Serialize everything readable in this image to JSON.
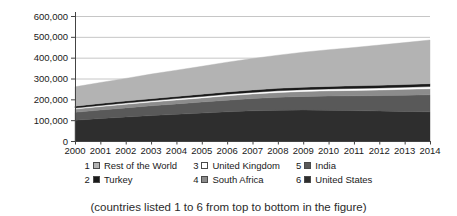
{
  "figure": {
    "caption": "(countries listed 1 to 6 from top to bottom in the figure)"
  },
  "chart_data": {
    "type": "area",
    "stacked": true,
    "title": "",
    "xlabel": "",
    "ylabel": "",
    "grid": true,
    "legend_position": "bottom",
    "ylim": [
      0,
      600000
    ],
    "y_ticks": [
      {
        "value": 0,
        "label": "0"
      },
      {
        "value": 100000,
        "label": "100,000"
      },
      {
        "value": 200000,
        "label": "200,000"
      },
      {
        "value": 300000,
        "label": "300,000"
      },
      {
        "value": 400000,
        "label": "400,000"
      },
      {
        "value": 500000,
        "label": "500,000"
      },
      {
        "value": 600000,
        "label": "600,000"
      }
    ],
    "x": [
      2000,
      2001,
      2002,
      2003,
      2004,
      2005,
      2006,
      2007,
      2008,
      2009,
      2010,
      2011,
      2012,
      2013,
      2014
    ],
    "x_tick_labels": [
      "2000",
      "2001",
      "2002",
      "2003",
      "2004",
      "2005",
      "2006",
      "2007",
      "2008",
      "2009",
      "2010",
      "2011",
      "2012",
      "2013",
      "2014"
    ],
    "series_order_note": "bottom to top in the stack",
    "series": [
      {
        "name": "United States",
        "legend_index": 6,
        "color": "#2e2e2e",
        "values": [
          100000,
          108000,
          115000,
          122000,
          128000,
          134000,
          140000,
          145000,
          148000,
          149000,
          148000,
          146000,
          144000,
          142000,
          140000
        ]
      },
      {
        "name": "India",
        "legend_index": 5,
        "color": "#595959",
        "values": [
          38000,
          41000,
          44000,
          47000,
          50000,
          53000,
          56000,
          59000,
          62000,
          65000,
          68000,
          71000,
          74000,
          78000,
          82000
        ]
      },
      {
        "name": "South Africa",
        "legend_index": 4,
        "color": "#8c8c8c",
        "values": [
          15000,
          16000,
          17000,
          18000,
          19000,
          20000,
          21000,
          22000,
          23000,
          24000,
          25000,
          26000,
          27000,
          28000,
          29000
        ]
      },
      {
        "name": "United Kingdom",
        "legend_index": 3,
        "color": "#ffffff",
        "values": [
          5000,
          5400,
          5700,
          6100,
          6400,
          6800,
          7100,
          7500,
          7900,
          8200,
          8600,
          8900,
          9300,
          9600,
          10000
        ]
      },
      {
        "name": "Turkey",
        "legend_index": 2,
        "color": "#1a1a1a",
        "values": [
          9000,
          9400,
          9700,
          10100,
          10400,
          10800,
          11100,
          11500,
          11900,
          12200,
          12600,
          12900,
          13300,
          13600,
          14000
        ]
      },
      {
        "name": "Rest of the World",
        "legend_index": 1,
        "color": "#b3b3b3",
        "values": [
          93000,
          101000,
          109000,
          118000,
          126000,
          134000,
          143000,
          151000,
          159000,
          168000,
          176000,
          184000,
          193000,
          201000,
          210000
        ]
      }
    ]
  },
  "legend": {
    "items": [
      {
        "index": "1",
        "label": "Rest of the World",
        "color": "#b3b3b3"
      },
      {
        "index": "2",
        "label": "Turkey",
        "color": "#1a1a1a"
      },
      {
        "index": "3",
        "label": "United Kingdom",
        "color": "#ffffff"
      },
      {
        "index": "4",
        "label": "South Africa",
        "color": "#8c8c8c"
      },
      {
        "index": "5",
        "label": "India",
        "color": "#595959"
      },
      {
        "index": "6",
        "label": "United States",
        "color": "#2e2e2e"
      }
    ]
  },
  "style": {
    "gridline_color": "#c6c6c6",
    "axis_color": "#444444",
    "tick_label_color": "#1a1a1a"
  }
}
